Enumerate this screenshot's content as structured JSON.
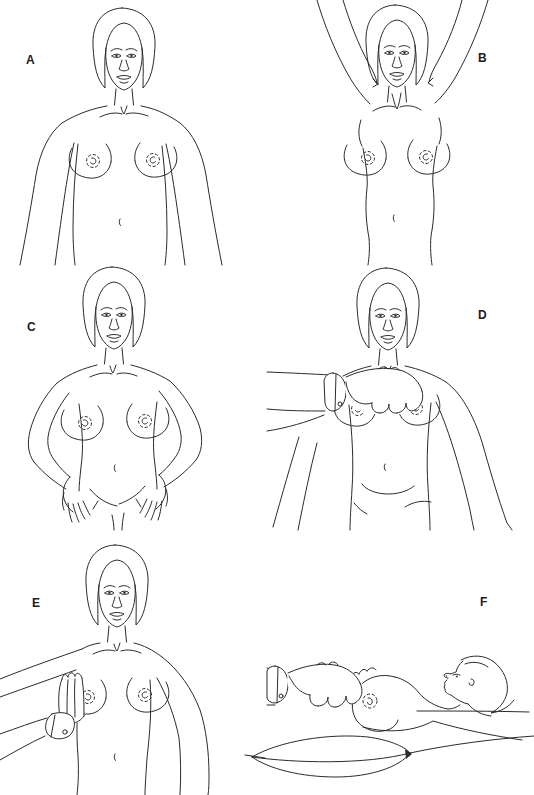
{
  "figure": {
    "paper_color": "#ffffff",
    "ink_color": "#2b2b2b",
    "panels": [
      {
        "label": "A",
        "label_side": "left",
        "depicts": "woman standing facing forward, arms relaxed at sides"
      },
      {
        "label": "B",
        "label_side": "right",
        "depicts": "woman facing forward with both arms raised overhead"
      },
      {
        "label": "C",
        "label_side": "left",
        "depicts": "woman facing forward pressing hands on hips"
      },
      {
        "label": "D",
        "label_side": "right",
        "depicts": "examiner's hand palpating the breast while woman stands"
      },
      {
        "label": "E",
        "label_side": "left",
        "depicts": "woman's arm extended to the side while examiner palpates the axilla"
      },
      {
        "label": "F",
        "label_side": "right",
        "depicts": "woman lying supine with pillow under shoulder while examiner palpates the breast"
      }
    ]
  }
}
